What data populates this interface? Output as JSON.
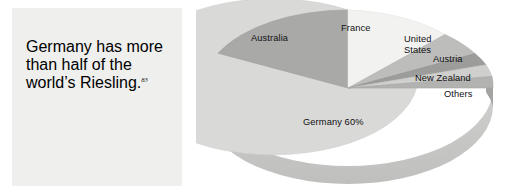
{
  "figure": {
    "quote": {
      "text": "Germany has more than half of the world’s Riesling.",
      "reference": "83"
    }
  },
  "chart_data": {
    "type": "pie",
    "title": "",
    "style": "3d-pie",
    "legend_position": "none",
    "labels_on_slices": true,
    "categories": [
      "Germany",
      "Australia",
      "France",
      "United States",
      "Austria",
      "New Zealand",
      "Others"
    ],
    "values": [
      60,
      17,
      10,
      5,
      3,
      3,
      2
    ],
    "value_labels": [
      "Germany 60%",
      "Australia",
      "France",
      "United States",
      "Austria",
      "New Zealand",
      "Others"
    ],
    "colors": [
      "#d9d9d8",
      "#a9a9a8",
      "#f2f2f1",
      "#bdbdbc",
      "#9c9c9b",
      "#cfcfce",
      "#b2b2b1"
    ],
    "slices": [
      {
        "name": "Germany",
        "label": "Germany 60%",
        "value": 60,
        "color": "#d9d9d8",
        "side_color": "#c6c6c5"
      },
      {
        "name": "Australia",
        "label": "Australia",
        "value": 17,
        "color": "#a9a9a8",
        "side_color": "#969695"
      },
      {
        "name": "France",
        "label": "France",
        "value": 10,
        "color": "#f2f2f1",
        "side_color": "#dddddc"
      },
      {
        "name": "United States",
        "label": "United States",
        "value": 5,
        "color": "#bdbdbc",
        "side_color": "#a9a9a8"
      },
      {
        "name": "Austria",
        "label": "Austria",
        "value": 3,
        "color": "#9c9c9b",
        "side_color": "#8a8a89"
      },
      {
        "name": "New Zealand",
        "label": "New Zealand",
        "value": 3,
        "color": "#cfcfce",
        "side_color": "#bcbcbb"
      },
      {
        "name": "Others",
        "label": "Others",
        "value": 2,
        "color": "#b2b2b1",
        "side_color": "#9f9f9e"
      }
    ]
  }
}
